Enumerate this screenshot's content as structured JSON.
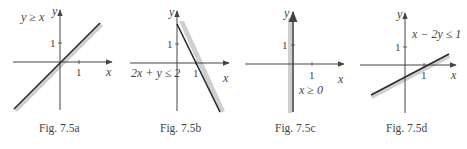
{
  "figures": [
    {
      "id": "a",
      "caption": "Fig. 7.5a",
      "inequality": "y ≥ x",
      "axis_x_label": "x",
      "axis_y_label": "y",
      "tick_x": "1",
      "tick_y": "1",
      "boundary": "y = x",
      "shaded_side": "below-right"
    },
    {
      "id": "b",
      "caption": "Fig. 7.5b",
      "inequality": "2x + y ≤ 2",
      "axis_x_label": "x",
      "axis_y_label": "y",
      "tick_x": "1",
      "tick_y": "1",
      "boundary": "2x + y = 2",
      "shaded_side": "right"
    },
    {
      "id": "c",
      "caption": "Fig. 7.5c",
      "inequality": "x ≥ 0",
      "axis_x_label": "x",
      "axis_y_label": "y",
      "tick_x": "1",
      "tick_y": "1",
      "boundary": "x = 0",
      "shaded_side": "left"
    },
    {
      "id": "d",
      "caption": "Fig. 7.5d",
      "inequality": "x − 2y ≤ 1",
      "axis_x_label": "x",
      "axis_y_label": "y",
      "tick_x": "1",
      "tick_y": "1",
      "boundary": "x − 2y = 1",
      "shaded_side": "below"
    }
  ],
  "colors": {
    "axis": "#444444",
    "line": "#2a2a2a",
    "shade": "#cfcfcf"
  }
}
